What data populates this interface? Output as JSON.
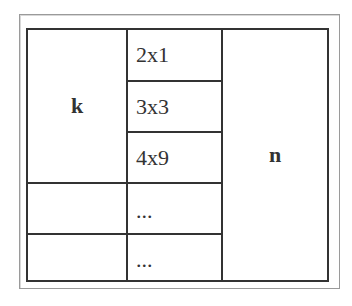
{
  "diagram": {
    "type": "table-structure",
    "left_label": "k",
    "right_label": "n",
    "middle_entries": [
      {
        "label": "2x1"
      },
      {
        "label": "3x3"
      },
      {
        "label": "4x9"
      },
      {
        "label": "..."
      },
      {
        "label": "..."
      }
    ],
    "colors": {
      "border": "#333333",
      "frame": "#9a9a9a",
      "text": "#333333",
      "background": "#ffffff"
    }
  }
}
